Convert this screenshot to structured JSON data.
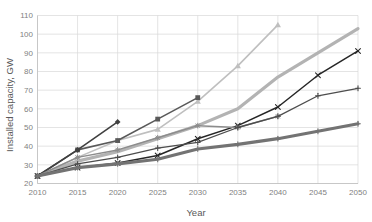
{
  "chart_data": {
    "type": "line",
    "title": "",
    "xlabel": "Year",
    "ylabel": "Installed capacity, GW",
    "x": [
      2010,
      2015,
      2020,
      2025,
      2030,
      2035,
      2040,
      2045,
      2050
    ],
    "xlim": [
      2010,
      2050
    ],
    "ylim": [
      20,
      110
    ],
    "xticks": [
      "2010",
      "2015",
      "2020",
      "2025",
      "2030",
      "2035",
      "2040",
      "2045",
      "2050"
    ],
    "yticks": [
      "20",
      "30",
      "40",
      "50",
      "60",
      "70",
      "80",
      "90",
      "100",
      "110"
    ],
    "grid": true,
    "legend": "none",
    "series": [
      {
        "name": "series-1-light-gray-triangle",
        "color": "#bfbfbf",
        "width": 1.6,
        "marker": "triangle",
        "x": [
          2010,
          2015,
          2020,
          2025,
          2030,
          2035,
          2040
        ],
        "values": [
          24,
          34,
          43,
          49,
          64,
          83,
          105
        ]
      },
      {
        "name": "series-2-light-gray-thick",
        "color": "#b3b3b3",
        "width": 3.2,
        "marker": "none",
        "x": [
          2010,
          2015,
          2020,
          2025,
          2030,
          2035,
          2040,
          2045,
          2050
        ],
        "values": [
          24,
          32,
          37,
          44,
          51,
          60,
          77,
          90,
          103
        ]
      },
      {
        "name": "series-3-dark-square",
        "color": "#595959",
        "width": 1.6,
        "marker": "square",
        "x": [
          2010,
          2015,
          2020,
          2025,
          2030
        ],
        "values": [
          24,
          38,
          43,
          54.5,
          66
        ]
      },
      {
        "name": "series-4-dark-diamond",
        "color": "#404040",
        "width": 1.6,
        "marker": "diamond",
        "x": [
          2010,
          2015,
          2020
        ],
        "values": [
          24,
          38,
          53
        ]
      },
      {
        "name": "series-5-black-cross",
        "color": "#262626",
        "width": 1.5,
        "marker": "cross",
        "x": [
          2010,
          2015,
          2020,
          2025,
          2030,
          2035,
          2040,
          2045,
          2050
        ],
        "values": [
          24,
          28.5,
          31,
          35,
          44,
          51,
          61,
          78,
          91
        ]
      },
      {
        "name": "series-6-medium-gray-star",
        "color": "#8c8c8c",
        "width": 1.5,
        "marker": "star",
        "x": [
          2010,
          2015,
          2020,
          2025,
          2030,
          2035,
          2040
        ],
        "values": [
          24,
          34,
          38,
          44.5,
          51,
          50,
          56
        ]
      },
      {
        "name": "series-7-dark-thin",
        "color": "#4d4d4d",
        "width": 1.3,
        "marker": "plus",
        "x": [
          2010,
          2015,
          2020,
          2025,
          2030,
          2035,
          2040,
          2045,
          2050
        ],
        "values": [
          24,
          30.5,
          34,
          39,
          42,
          50,
          56,
          67,
          71
        ]
      },
      {
        "name": "series-8-gray-thick-bottom",
        "color": "#737373",
        "width": 3.2,
        "marker": "plus",
        "x": [
          2010,
          2015,
          2020,
          2025,
          2030,
          2035,
          2040,
          2045,
          2050
        ],
        "values": [
          24,
          28.5,
          30.5,
          33,
          38.5,
          41,
          44,
          48,
          52
        ]
      }
    ]
  },
  "axes": {
    "y_title": "Installed capacity, GW",
    "x_title": "Year"
  }
}
